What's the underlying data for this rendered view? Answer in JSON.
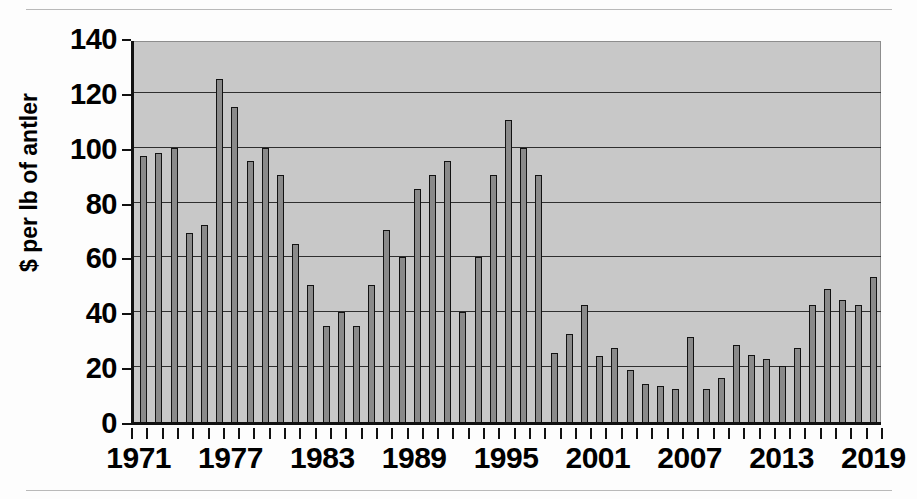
{
  "chart_data": {
    "type": "bar",
    "title": "",
    "subtitle": "",
    "xlabel": "",
    "ylabel": "$ per lb of antler",
    "ylim": [
      0,
      140
    ],
    "ytick_step": 20,
    "yticks": [
      0,
      20,
      40,
      60,
      80,
      100,
      120,
      140
    ],
    "ytick_labels": [
      "0",
      "20",
      "40",
      "60",
      "80",
      "100",
      "120",
      "140"
    ],
    "grid": true,
    "legend": false,
    "legend_position": "none",
    "plot_background": "#c8c8c8",
    "bar_fill": "#8a8a8a",
    "bar_outline": "#121212",
    "xtick_labels_shown": [
      "1971",
      "1977",
      "1983",
      "1989",
      "1995",
      "2001",
      "2007",
      "2013",
      "2019"
    ],
    "xtick_label_interval": 6,
    "categories": [
      "1971",
      "1972",
      "1973",
      "1974",
      "1975",
      "1976",
      "1977",
      "1978",
      "1979",
      "1980",
      "1981",
      "1982",
      "1983",
      "1984",
      "1985",
      "1986",
      "1987",
      "1988",
      "1989",
      "1990",
      "1991",
      "1992",
      "1993",
      "1994",
      "1995",
      "1996",
      "1997",
      "1998",
      "1999",
      "2000",
      "2001",
      "2002",
      "2003",
      "2004",
      "2005",
      "2006",
      "2007",
      "2008",
      "2009",
      "2010",
      "2011",
      "2012",
      "2013",
      "2014",
      "2015",
      "2016",
      "2017",
      "2018",
      "2019"
    ],
    "values": [
      97,
      98,
      100,
      69,
      72,
      125,
      115,
      95,
      100,
      90,
      65,
      50,
      35,
      40,
      35,
      50,
      70,
      60,
      85,
      90,
      95,
      40,
      60,
      90,
      110,
      100,
      90,
      25,
      32,
      42.5,
      24,
      27,
      19,
      14,
      13,
      12,
      31,
      12,
      16,
      28,
      24.5,
      23,
      20.5,
      27,
      42.5,
      48.5,
      44.5,
      42.5,
      53
    ]
  },
  "yaxis": {
    "title": "$ per lb of antler"
  },
  "note": {
    "last_bar_value": "40"
  }
}
